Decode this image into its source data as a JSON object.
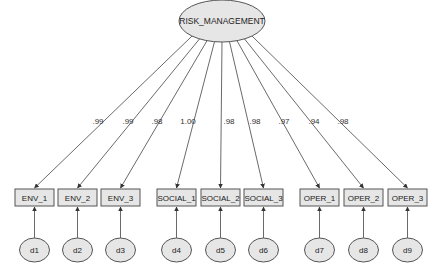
{
  "diagram": {
    "type": "structural-equation-model",
    "latent": {
      "label": "RISK_MANAGEMENT",
      "cx": 222,
      "cy": 21,
      "rx": 43,
      "ry": 21
    },
    "colors": {
      "fill": "#e6e6e6",
      "stroke": "#555555",
      "line": "#444444",
      "text": "#222222"
    },
    "indicators": [
      {
        "label": "ENV_1",
        "x": 15,
        "loading": ".99",
        "error": "d1",
        "label_x": 98,
        "label_y": 124
      },
      {
        "label": "ENV_2",
        "x": 58,
        "loading": ".99",
        "error": "d2",
        "label_x": 128,
        "label_y": 124
      },
      {
        "label": "ENV_3",
        "x": 101,
        "loading": ".98",
        "error": "d3",
        "label_x": 157,
        "label_y": 124
      },
      {
        "label": "SOCIAL_1",
        "x": 157,
        "loading": "1.00",
        "error": "d4",
        "label_x": 188,
        "label_y": 124
      },
      {
        "label": "SOCIAL_2",
        "x": 201,
        "loading": ".98",
        "error": "d5",
        "label_x": 229,
        "label_y": 124
      },
      {
        "label": "SOCIAL_3",
        "x": 244,
        "loading": ".98",
        "error": "d6",
        "label_x": 255,
        "label_y": 124
      },
      {
        "label": "OPER_1",
        "x": 300,
        "loading": ".97",
        "error": "d7",
        "label_x": 284,
        "label_y": 124
      },
      {
        "label": "OPER_2",
        "x": 344,
        "loading": ".94",
        "error": "d8",
        "label_x": 314,
        "label_y": 124
      },
      {
        "label": "OPER_3",
        "x": 388,
        "loading": ".98",
        "error": "d9",
        "label_x": 343,
        "label_y": 124
      }
    ]
  }
}
